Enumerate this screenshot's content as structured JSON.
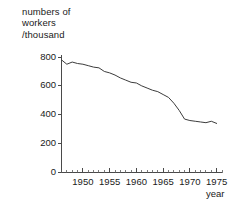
{
  "chart_data": {
    "type": "line",
    "title": "",
    "ylabel": "numbers of workers /thousand",
    "ylabel_lines": [
      "numbers of",
      "workers",
      "/thousand"
    ],
    "xlabel": "year",
    "xlim": [
      1946,
      1976
    ],
    "ylim": [
      0,
      850
    ],
    "grid": false,
    "legend": null,
    "yticks": [
      0,
      200,
      400,
      600,
      800
    ],
    "ytick_labels": [
      "0",
      "200",
      "400",
      "600",
      "800"
    ],
    "xticks": [
      1950,
      1955,
      1960,
      1965,
      1970,
      1975
    ],
    "xtick_labels": [
      "1950",
      "1955",
      "1960",
      "1965",
      "1970",
      "1975"
    ],
    "x_minor_tick_interval": 1,
    "x": [
      1946,
      1947,
      1948,
      1949,
      1950,
      1951,
      1952,
      1953,
      1954,
      1955,
      1956,
      1957,
      1958,
      1959,
      1960,
      1961,
      1962,
      1963,
      1964,
      1965,
      1966,
      1967,
      1968,
      1969,
      1970,
      1971,
      1972,
      1973,
      1974,
      1975
    ],
    "values": [
      780,
      750,
      765,
      755,
      750,
      740,
      730,
      725,
      700,
      690,
      675,
      655,
      640,
      625,
      620,
      600,
      585,
      570,
      560,
      540,
      520,
      480,
      430,
      370,
      360,
      355,
      350,
      345,
      355,
      340
    ],
    "series": [
      {
        "name": "numbers of workers",
        "values": [
          780,
          750,
          765,
          755,
          750,
          740,
          730,
          725,
          700,
          690,
          675,
          655,
          640,
          625,
          620,
          600,
          585,
          570,
          560,
          540,
          520,
          480,
          430,
          370,
          360,
          355,
          350,
          345,
          355,
          340
        ]
      }
    ],
    "line_color": "#3c3c3c",
    "axis_color": "#4a4a4a",
    "background": "#ffffff"
  }
}
